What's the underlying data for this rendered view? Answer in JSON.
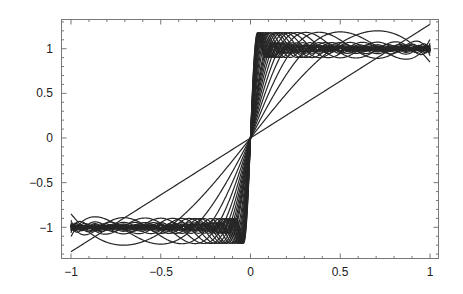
{
  "chart_data": {
    "type": "line",
    "title": "",
    "xlabel": "",
    "ylabel": "",
    "xlim": [
      -1,
      1
    ],
    "ylim": [
      -1.33,
      1.33
    ],
    "grid": false,
    "legend": null,
    "x_ticks": [
      -1,
      -0.5,
      0,
      0.5,
      1
    ],
    "x_tick_labels": [
      "−1",
      "−0.5",
      "0",
      "0.5",
      "1"
    ],
    "y_ticks": [
      -1,
      -0.5,
      0,
      0.5,
      1
    ],
    "y_tick_labels": [
      "−1",
      "−0.5",
      "0",
      "0.5",
      "1"
    ],
    "series_term_counts": [
      1,
      2,
      3,
      4,
      5,
      6,
      7,
      8,
      9,
      10,
      11,
      12,
      14,
      16,
      18,
      20,
      22,
      24,
      26,
      28,
      30,
      32,
      34,
      36,
      38,
      40
    ],
    "series_samples": [
      {
        "name": "S1 (degree 1)",
        "x": [
          -1,
          -0.5,
          0,
          0.5,
          1
        ],
        "y": [
          -1.273,
          -0.637,
          0,
          0.637,
          1.273
        ]
      },
      {
        "name": "S2 (degree 3)",
        "x": [
          -1,
          -0.5,
          0,
          0.5,
          1
        ],
        "y": [
          -0.849,
          -1.061,
          0,
          1.061,
          0.849
        ]
      },
      {
        "name": "S3 (degree 5)",
        "x": [
          -1,
          -0.5,
          0,
          0.5,
          1
        ],
        "y": [
          -1.104,
          -0.934,
          0,
          0.934,
          1.104
        ]
      },
      {
        "name": "S4 (degree 7)",
        "x": [
          -1,
          -0.5,
          0,
          0.5,
          1
        ],
        "y": [
          -0.922,
          -0.934,
          0,
          0.934,
          0.922
        ]
      }
    ],
    "line_color": "#262626"
  },
  "axes": {
    "x_labels": [
      "−1",
      "−0.5",
      "0",
      "0.5",
      "1"
    ],
    "y_labels": [
      "1",
      "0.5",
      "0",
      "−0.5",
      "−1"
    ]
  }
}
